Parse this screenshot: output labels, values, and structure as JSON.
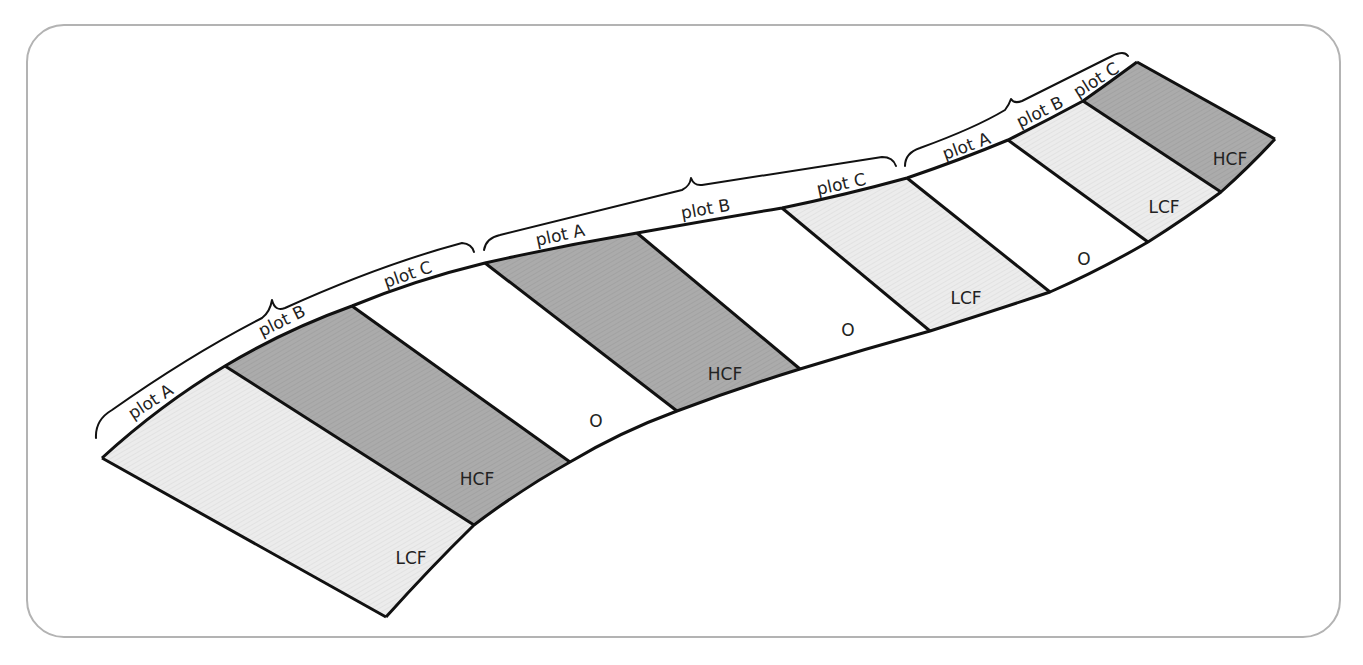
{
  "diagram": {
    "title": "",
    "colors": {
      "LCF": "#ebebeb",
      "HCF": "#a9a9a9",
      "O": "#ffffff",
      "frame": "#b3b3b3",
      "stroke": "#111111"
    },
    "blocks": [
      {
        "name": "block-1",
        "plots": [
          {
            "label": "plot A",
            "treatment": "LCF"
          },
          {
            "label": "plot B",
            "treatment": "HCF"
          },
          {
            "label": "plot C",
            "treatment": "O"
          }
        ]
      },
      {
        "name": "block-2",
        "plots": [
          {
            "label": "plot A",
            "treatment": "HCF"
          },
          {
            "label": "plot B",
            "treatment": "O"
          },
          {
            "label": "plot C",
            "treatment": "LCF"
          }
        ]
      },
      {
        "name": "block-3",
        "plots": [
          {
            "label": "plot A",
            "treatment": "O"
          },
          {
            "label": "plot B",
            "treatment": "LCF"
          },
          {
            "label": "plot C",
            "treatment": "HCF"
          }
        ]
      }
    ],
    "plot_labels": [
      "plot A",
      "plot B",
      "plot C",
      "plot A",
      "plot B",
      "plot C",
      "plot A",
      "plot B",
      "plot C"
    ],
    "treatment_labels": [
      "LCF",
      "HCF",
      "O",
      "HCF",
      "O",
      "LCF",
      "O",
      "LCF",
      "HCF"
    ]
  }
}
